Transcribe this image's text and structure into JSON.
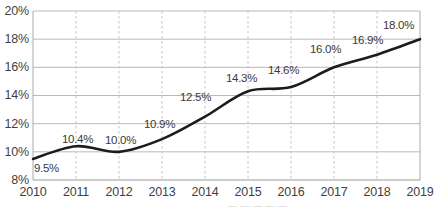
{
  "chart_data": {
    "type": "line",
    "title": "",
    "subtitle": "",
    "xlabel": "",
    "ylabel": "",
    "categories": [
      "2010",
      "2011",
      "2012",
      "2013",
      "2014",
      "2015",
      "2016",
      "2017",
      "2018",
      "2019"
    ],
    "values": [
      9.5,
      10.4,
      10.0,
      10.9,
      12.5,
      14.3,
      14.6,
      16.0,
      16.9,
      18.0
    ],
    "point_labels": [
      "9.5%",
      "10.4%",
      "10.0%",
      "10.9%",
      "12.5%",
      "14.3%",
      "14.6%",
      "16.0%",
      "16.9%",
      "18.0%"
    ],
    "ylim": [
      8,
      20
    ],
    "ytick_values": [
      8,
      10,
      12,
      14,
      16,
      18,
      20
    ],
    "ytick_labels": [
      "8%",
      "10%",
      "12%",
      "14%",
      "16%",
      "18%",
      "20%"
    ],
    "xtick_labels": [
      "2010",
      "2011",
      "2012",
      "2013",
      "2014",
      "2015",
      "2016",
      "2017",
      "2018",
      "2019"
    ],
    "grid": {
      "horizontal": true,
      "vertical": true,
      "horizontal_style": "solid",
      "vertical_style": "dashed"
    },
    "legend": {
      "visible": false,
      "position": "none",
      "entries": []
    },
    "series": [
      {
        "name": "",
        "values": [
          9.5,
          10.4,
          10.0,
          10.9,
          12.5,
          14.3,
          14.6,
          16.0,
          16.9,
          18.0
        ]
      }
    ],
    "annotations": []
  },
  "colors": {
    "line": "#1c1c1c",
    "grid_horizontal": "#b9b9b9",
    "grid_vertical": "#c4c4c4",
    "axis": "#aaaaaa",
    "tick_text": "#3f3f3f",
    "label_text": "#3a3a3a",
    "background": "#ffffff"
  },
  "footer": {
    "truncated_text": "— — — — —"
  }
}
